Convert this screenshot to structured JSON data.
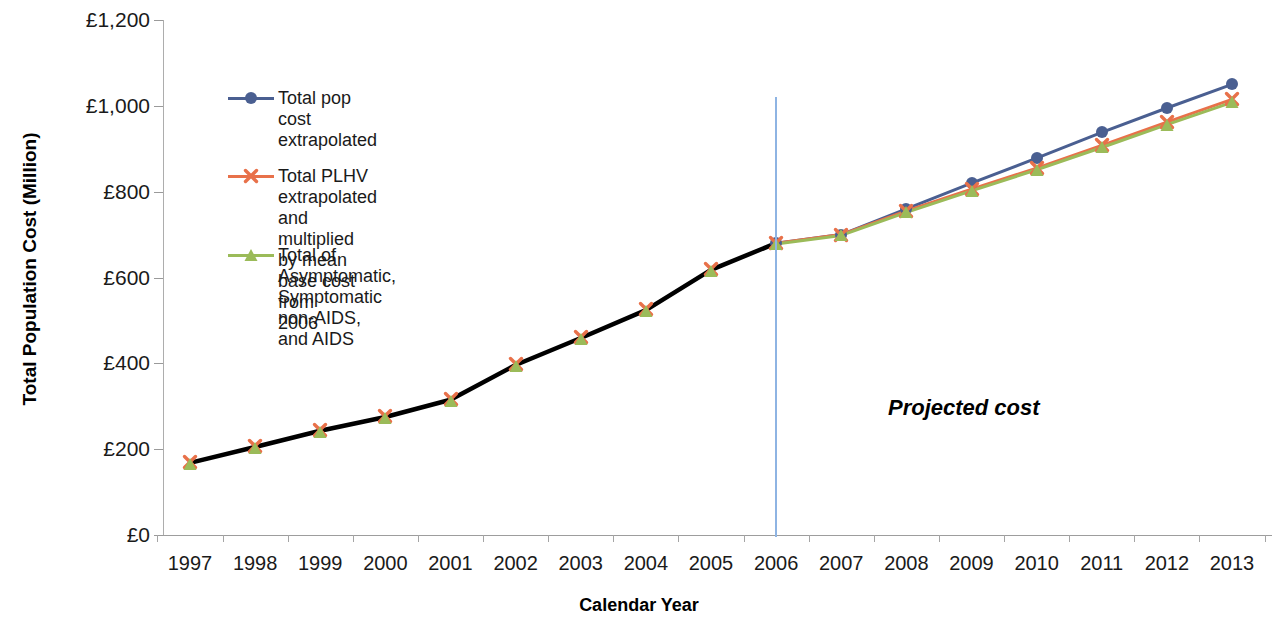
{
  "chart_data": {
    "type": "line",
    "title": "",
    "xlabel": "Calendar Year",
    "ylabel": "Total Population Cost (Million)",
    "categories": [
      "1997",
      "1998",
      "1999",
      "2000",
      "2001",
      "2002",
      "2003",
      "2004",
      "2005",
      "2006",
      "2007",
      "2008",
      "2009",
      "2010",
      "2011",
      "2012",
      "2013"
    ],
    "x": [
      1997,
      1998,
      1999,
      2000,
      2001,
      2002,
      2003,
      2004,
      2005,
      2006,
      2007,
      2008,
      2009,
      2010,
      2011,
      2012,
      2013
    ],
    "ylim": [
      0,
      1200
    ],
    "xlim": [
      1997,
      2013
    ],
    "y_tick_values": [
      0,
      200,
      400,
      600,
      800,
      1000,
      1200
    ],
    "y_tick_labels": [
      "£0",
      "£200",
      "£400",
      "£600",
      "£800",
      "£1,000",
      "£1,200"
    ],
    "grid": false,
    "legend_position": "upper-left-inside",
    "currency_symbol": "£",
    "series": [
      {
        "name": "Total pop cost extrapolated",
        "color": "#4a5f91",
        "marker": "circle",
        "values": [
          168,
          205,
          243,
          275,
          315,
          396,
          459,
          524,
          618,
          680,
          700,
          760,
          820,
          878,
          938,
          995,
          1050
        ]
      },
      {
        "name": "Total PLHV extrapolated and\nmultiplied by mean base cost from\n2006",
        "color": "#e8714a",
        "marker": "x",
        "values": [
          170,
          207,
          245,
          277,
          317,
          398,
          461,
          526,
          620,
          680,
          700,
          755,
          806,
          855,
          908,
          962,
          1015
        ]
      },
      {
        "name": "Total of Asymptomatic, Symptomatic\nnon-AIDS, and AIDS",
        "color": "#9bbb59",
        "marker": "triangle",
        "values": [
          165,
          203,
          241,
          273,
          313,
          393,
          456,
          521,
          615,
          678,
          698,
          752,
          802,
          851,
          903,
          956,
          1008
        ]
      }
    ],
    "historical_line_color": "#000000",
    "historical_range": [
      "1997",
      "2006"
    ],
    "annotations": [
      {
        "text": "Projected cost",
        "x_year": 2009.5,
        "y_value": 280,
        "style": "bold-italic"
      }
    ],
    "divider": {
      "x_year": 2006,
      "color": "#8eb4e3",
      "label": "projection-start-divider"
    }
  },
  "legend": {
    "items": [
      {
        "label": "Total pop cost extrapolated",
        "color": "#4a5f91",
        "marker": "circle"
      },
      {
        "label": "Total PLHV extrapolated and\nmultiplied by mean base cost from\n2006",
        "color": "#e8714a",
        "marker": "x"
      },
      {
        "label": "Total of Asymptomatic, Symptomatic\nnon-AIDS, and AIDS",
        "color": "#9bbb59",
        "marker": "triangle"
      }
    ]
  },
  "axes": {
    "y_title": "Total Population Cost (Million)",
    "x_title": "Calendar Year"
  },
  "annotation": {
    "projected": "Projected cost"
  }
}
